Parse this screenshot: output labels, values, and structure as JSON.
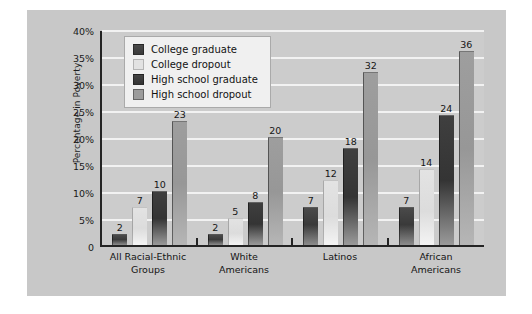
{
  "chart_data": {
    "type": "bar",
    "title": "",
    "xlabel": "",
    "ylabel": "Percentage in Poverty",
    "ylim": [
      0,
      40
    ],
    "ytick_labels": [
      "40%",
      "35%",
      "30%",
      "25%",
      "20%",
      "15%",
      "10%",
      "5%",
      "0"
    ],
    "ytick_values": [
      40,
      35,
      30,
      25,
      20,
      15,
      10,
      5,
      0
    ],
    "grid": true,
    "legend_position": "top-left-inside",
    "categories": [
      "All Racial-Ethnic Groups",
      "White Americans",
      "Latinos",
      "African Americans"
    ],
    "category_lines": [
      [
        "All Racial-Ethnic",
        "Groups"
      ],
      [
        "White",
        "Americans"
      ],
      [
        "Latinos",
        ""
      ],
      [
        "African",
        "Americans"
      ]
    ],
    "series": [
      {
        "name": "College graduate",
        "color": "#3a3a3a",
        "values": [
          2,
          2,
          7,
          7
        ]
      },
      {
        "name": "College dropout",
        "color": "#e2e2e2",
        "values": [
          7,
          5,
          12,
          14
        ]
      },
      {
        "name": "High school graduate",
        "color": "#343434",
        "values": [
          10,
          8,
          18,
          24
        ]
      },
      {
        "name": "High school dropout",
        "color": "#9c9c9c",
        "values": [
          23,
          20,
          32,
          36
        ]
      }
    ]
  },
  "colors": {
    "figure_background": "#c8c8c8",
    "plot_background": "#cccccc",
    "gridline": "#f2f2f2",
    "axis": "#242424",
    "text": "#141414",
    "legend_background": "#f0f0f0"
  }
}
